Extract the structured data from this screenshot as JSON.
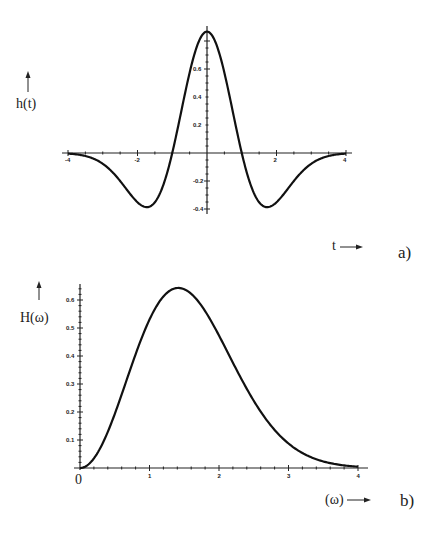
{
  "chart_data": [
    {
      "type": "line",
      "panel_label": "a)",
      "title": "",
      "xlabel": "t",
      "ylabel": "h(t)",
      "xlim": [
        -4,
        4
      ],
      "ylim": [
        -0.4,
        0.87
      ],
      "grid": false,
      "legend": null,
      "xticks": [
        -4,
        -2,
        2,
        4
      ],
      "xtick_labels": [
        "-4",
        "-2",
        "2",
        "4"
      ],
      "yticks": [
        -0.4,
        -0.2,
        0.2,
        0.4,
        0.6
      ],
      "ytick_labels": [
        "-0.4",
        "-0.2",
        "0.2",
        "0.4",
        "0.6"
      ],
      "description": "Mexican hat wavelet h(t) = 0.867(1 - t^2) e^(-t^2/2)",
      "series": [
        {
          "name": "h(t)",
          "x": [
            -4,
            -3.5,
            -3,
            -2.5,
            -2,
            -1.732,
            -1.5,
            -1.25,
            -1,
            -0.75,
            -0.5,
            -0.25,
            0,
            0.25,
            0.5,
            0.75,
            1,
            1.25,
            1.5,
            1.732,
            2,
            2.5,
            3,
            3.5,
            4
          ],
          "values": [
            -0.004,
            -0.023,
            -0.077,
            -0.17,
            -0.352,
            -0.387,
            -0.352,
            -0.214,
            0,
            0.287,
            0.574,
            0.79,
            0.867,
            0.79,
            0.574,
            0.287,
            0,
            -0.214,
            -0.352,
            -0.387,
            -0.352,
            -0.17,
            -0.077,
            -0.023,
            -0.004
          ]
        }
      ]
    },
    {
      "type": "line",
      "panel_label": "b)",
      "title": "",
      "xlabel": "(ω)",
      "ylabel": "H(ω)",
      "xlim": [
        0,
        4
      ],
      "ylim": [
        0,
        0.65
      ],
      "grid": false,
      "legend": null,
      "xticks": [
        1,
        2,
        3,
        4
      ],
      "xtick_labels": [
        "1",
        "2",
        "3",
        "4"
      ],
      "origin_label": "0",
      "yticks": [
        0.1,
        0.2,
        0.3,
        0.4,
        0.5,
        0.6
      ],
      "ytick_labels": [
        "0.1",
        "0.2",
        "0.3",
        "0.4",
        "0.5",
        "0.6"
      ],
      "description": "Fourier magnitude H(ω) = 0.874 ω² e^(-ω²/2), peak ≈0.643 at ω≈1.41",
      "series": [
        {
          "name": "H(ω)",
          "x": [
            0,
            0.25,
            0.5,
            0.75,
            1,
            1.25,
            1.414,
            1.5,
            1.75,
            2,
            2.25,
            2.5,
            2.75,
            3,
            3.25,
            3.5,
            3.75,
            4
          ],
          "values": [
            0,
            0.053,
            0.193,
            0.371,
            0.53,
            0.625,
            0.643,
            0.64,
            0.58,
            0.473,
            0.351,
            0.239,
            0.149,
            0.087,
            0.047,
            0.024,
            0.011,
            0.005
          ]
        }
      ]
    }
  ],
  "labels": {
    "top_ylabel": "h(t)",
    "top_xlabel": "t",
    "top_panel": "a)",
    "bottom_ylabel": "H(ω)",
    "bottom_xlabel": "(ω)",
    "bottom_panel": "b)",
    "bottom_origin": "0"
  }
}
